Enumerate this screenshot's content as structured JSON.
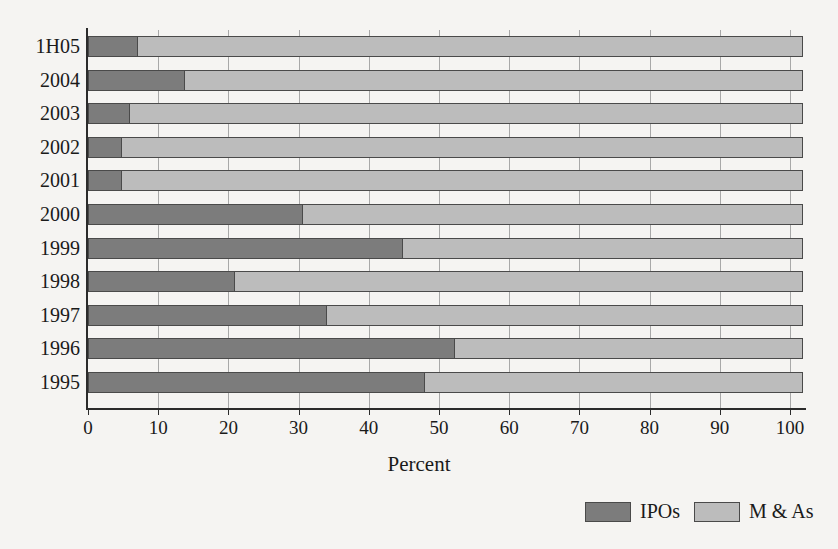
{
  "chart_data": {
    "type": "bar",
    "orientation": "horizontal",
    "stacked": true,
    "title": "",
    "xlabel": "Percent",
    "ylabel": "",
    "xlim": [
      0,
      102
    ],
    "grid": true,
    "legend_position": "bottom-right",
    "categories": [
      "1H05",
      "2004",
      "2003",
      "2002",
      "2001",
      "2000",
      "1999",
      "1998",
      "1997",
      "1996",
      "1995"
    ],
    "xticks": [
      0,
      10,
      20,
      30,
      40,
      50,
      60,
      70,
      80,
      90,
      100
    ],
    "xtick_labels": [
      "0",
      "10",
      "20",
      "30",
      "40",
      "50",
      "60",
      "70",
      "80",
      "90",
      "100"
    ],
    "series": [
      {
        "name": "IPOs",
        "color": "#7c7c7c",
        "values": [
          7.1,
          13.8,
          6.0,
          4.8,
          4.8,
          30.6,
          44.9,
          20.9,
          34.0,
          52.3,
          48.0
        ]
      },
      {
        "name": "M & As",
        "color": "#bcbcbc",
        "values": [
          94.9,
          88.2,
          96.0,
          97.2,
          97.2,
          71.4,
          57.1,
          81.1,
          68.0,
          49.7,
          54.0
        ]
      }
    ],
    "bar_totals": [
      102,
      102,
      102,
      102,
      102,
      102,
      102,
      102,
      102,
      102,
      102
    ]
  },
  "legend": {
    "items": [
      {
        "label": "IPOs",
        "color": "#7c7c7c"
      },
      {
        "label": "M & As",
        "color": "#bcbcbc"
      }
    ]
  },
  "axis": {
    "x_title": "Percent"
  },
  "style": {
    "background": "#f5f4f2",
    "axis_color": "#2b2b2b",
    "grid_color": "#a8a8a8",
    "bar_border": "#4a4a4a"
  }
}
